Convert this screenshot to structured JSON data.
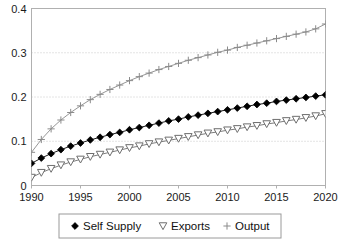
{
  "chart_data": {
    "type": "line",
    "title": "",
    "xlabel": "",
    "ylabel": "",
    "xlim": [
      1990,
      2020
    ],
    "ylim": [
      0,
      0.4
    ],
    "grid": true,
    "grid_axis": "y",
    "legend_position": "bottom",
    "x_ticks": [
      "1990",
      "1995",
      "2000",
      "2005",
      "2010",
      "2015",
      "2020"
    ],
    "x_tick_values": [
      1990,
      1995,
      2000,
      2005,
      2010,
      2015,
      2020
    ],
    "y_ticks": [
      "0",
      "0.1",
      "0.2",
      "0.3",
      "0.4"
    ],
    "y_tick_values": [
      0,
      0.1,
      0.2,
      0.3,
      0.4
    ],
    "x": [
      1990,
      1991,
      1992,
      1993,
      1994,
      1995,
      1996,
      1997,
      1998,
      1999,
      2000,
      2001,
      2002,
      2003,
      2004,
      2005,
      2006,
      2007,
      2008,
      2009,
      2010,
      2011,
      2012,
      2013,
      2014,
      2015,
      2016,
      2017,
      2018,
      2019,
      2020
    ],
    "series": [
      {
        "name": "Self Supply",
        "marker": "diamond-filled",
        "color": "#000000",
        "values": [
          0.05,
          0.062,
          0.072,
          0.081,
          0.089,
          0.096,
          0.103,
          0.109,
          0.115,
          0.12,
          0.126,
          0.131,
          0.136,
          0.141,
          0.146,
          0.15,
          0.155,
          0.159,
          0.163,
          0.167,
          0.171,
          0.175,
          0.179,
          0.183,
          0.186,
          0.19,
          0.193,
          0.196,
          0.199,
          0.202,
          0.205
        ]
      },
      {
        "name": "Exports",
        "marker": "triangle-down-open",
        "color": "#6e6e6e",
        "values": [
          0.018,
          0.029,
          0.038,
          0.046,
          0.053,
          0.059,
          0.065,
          0.07,
          0.075,
          0.08,
          0.085,
          0.089,
          0.094,
          0.098,
          0.102,
          0.106,
          0.11,
          0.114,
          0.118,
          0.121,
          0.125,
          0.128,
          0.132,
          0.135,
          0.139,
          0.142,
          0.146,
          0.149,
          0.153,
          0.157,
          0.162
        ]
      },
      {
        "name": "Output",
        "marker": "plus",
        "color": "#8a8a8a",
        "values": [
          0.075,
          0.104,
          0.128,
          0.148,
          0.165,
          0.18,
          0.194,
          0.206,
          0.217,
          0.227,
          0.237,
          0.246,
          0.254,
          0.262,
          0.269,
          0.276,
          0.283,
          0.289,
          0.295,
          0.301,
          0.306,
          0.312,
          0.317,
          0.322,
          0.327,
          0.332,
          0.337,
          0.342,
          0.347,
          0.354,
          0.365
        ]
      }
    ]
  },
  "legend": {
    "items": [
      {
        "label": "Self Supply"
      },
      {
        "label": "Exports"
      },
      {
        "label": "Output"
      }
    ]
  },
  "colors": {
    "plot_border": "#b0b0b0",
    "gridline": "#c8c8c8",
    "axis_text": "#1a1a1a",
    "legend_border": "#9a9a9a",
    "background": "#ffffff"
  }
}
